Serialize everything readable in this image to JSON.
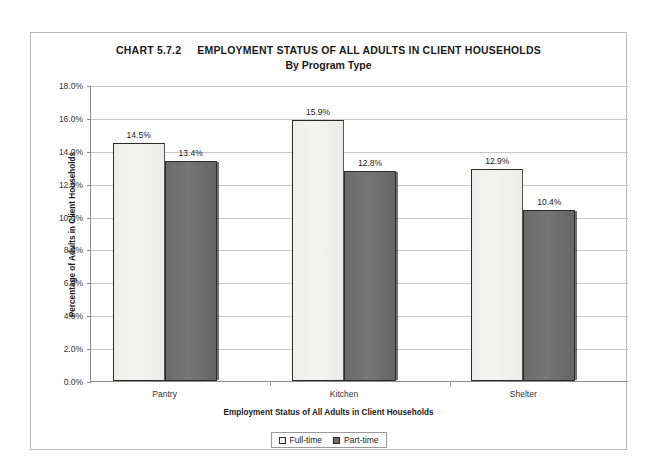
{
  "chart_data": {
    "type": "bar",
    "title_number": "CHART 5.7.2",
    "title_main": "EMPLOYMENT STATUS OF ALL ADULTS IN CLIENT HOUSEHOLDS",
    "subtitle": "By Program Type",
    "xlabel": "Employment Status of All Adults in Client Households",
    "ylabel": "Percentage of Adults in Client Households",
    "categories": [
      "Pantry",
      "Kitchen",
      "Shelter"
    ],
    "series": [
      {
        "name": "Full-time",
        "values": [
          14.5,
          12.9,
          12.9
        ],
        "color": "#f2f2f0"
      },
      {
        "name": "Part-time",
        "values": [
          13.4,
          12.8,
          10.4
        ],
        "color": "#6e6e6e"
      }
    ],
    "value_labels": [
      [
        "14.5%",
        "15.9%",
        "12.9%"
      ],
      [
        "13.4%",
        "12.8%",
        "10.4%"
      ]
    ],
    "bar_values": {
      "full_time": [
        14.5,
        15.9,
        12.9
      ],
      "part_time": [
        13.4,
        12.8,
        10.4
      ]
    },
    "ylim": [
      0,
      18
    ],
    "ytick_step": 2,
    "ytick_labels": [
      "18.0%",
      "16.0%",
      "14.0%",
      "12.0%",
      "10.0%",
      "8.0%",
      "6.0%",
      "4.0%",
      "2.0%",
      "0.0%"
    ],
    "ytick_values": [
      18,
      16,
      14,
      12,
      10,
      8,
      6,
      4,
      2,
      0
    ],
    "grid": true,
    "legend": {
      "position": "bottom",
      "entries": [
        "Full-time",
        "Part-time"
      ]
    }
  },
  "colors": {
    "frame": "#b9b9b9",
    "gridline": "#c8c8c8",
    "axis": "#8c8c8c",
    "full_time_bar": "#f2f2f0",
    "part_time_bar": "#6e6e6e",
    "bar_outline": "#2b2b2b",
    "text": "#1a1a1a",
    "background": "#ffffff"
  }
}
